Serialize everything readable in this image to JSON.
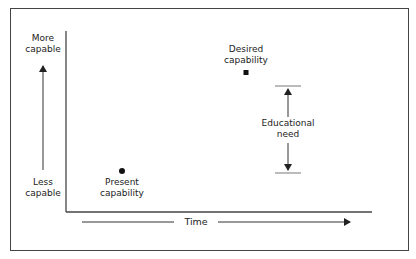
{
  "diagram": {
    "y_axis": {
      "top_label": "More capable",
      "top_label_lines": [
        "More",
        "capable"
      ],
      "bottom_label": "Less capable",
      "bottom_label_lines": [
        "Less",
        "capable"
      ]
    },
    "x_axis": {
      "label": "Time"
    },
    "points": [
      {
        "name": "present",
        "label_lines": [
          "Present",
          "capability"
        ],
        "marker": "circle"
      },
      {
        "name": "desired",
        "label_lines": [
          "Desired",
          "capability"
        ],
        "marker": "square"
      }
    ],
    "gap": {
      "label_lines": [
        "Educational",
        "need"
      ]
    },
    "colors": {
      "line": "#333333",
      "text": "#222222",
      "background": "#ffffff"
    }
  }
}
